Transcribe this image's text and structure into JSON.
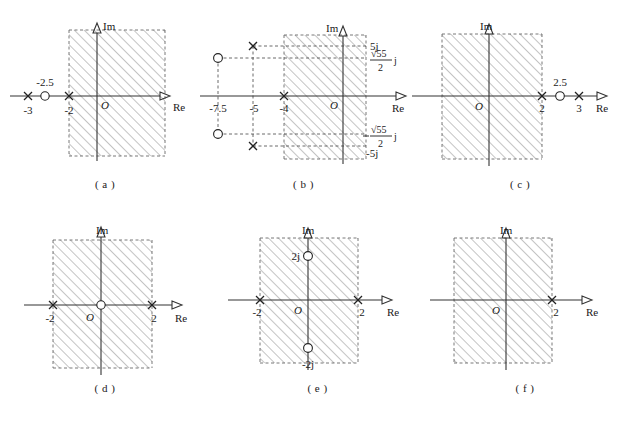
{
  "figure": {
    "type": "pole-zero-plots-with-roc",
    "panel_count": 6,
    "axis_labels": {
      "real": "Re",
      "imag": "Im",
      "origin": "O"
    },
    "marker_legend": {
      "pole": "x",
      "zero": "o"
    },
    "hatch_color": "#8a8a8a",
    "axis_color": "#333333"
  },
  "panels": [
    {
      "id": "a",
      "caption": "( a )",
      "im_label": "Im",
      "re_label": "Re",
      "origin_label": "O",
      "poles": [
        {
          "label": "-3",
          "re": -3,
          "im": 0
        },
        {
          "label": "-2",
          "re": -2,
          "im": 0
        }
      ],
      "zeros": [
        {
          "label": "-2.5",
          "re": -2.5,
          "im": 0
        }
      ],
      "roc": {
        "kind": "right-half",
        "boundary_label": "-2",
        "boundary_re": -2
      }
    },
    {
      "id": "b",
      "caption": "( b )",
      "im_label": "Im",
      "re_label": "Re",
      "origin_label": "O",
      "poles": [
        {
          "label": "-5",
          "re": -5,
          "im": 5
        },
        {
          "label": "-5",
          "re": -5,
          "im": -5
        },
        {
          "label": "-4",
          "re": -4,
          "im": 0
        }
      ],
      "zeros": [
        {
          "label": "-7.5",
          "re": -7.5,
          "im": 3.708
        },
        {
          "label": "-7.5",
          "re": -7.5,
          "im": -3.708
        }
      ],
      "axis_ticks": [
        "-7.5",
        "-5",
        "-4"
      ],
      "imag_ticks": [
        {
          "text": "5j",
          "kind": "plain"
        },
        {
          "text": "√55/2 j",
          "kind": "fraction",
          "numerator": "√55",
          "denominator": "2",
          "suffix": "j"
        },
        {
          "text": "√55/2 j",
          "kind": "fraction",
          "numerator": "√55",
          "denominator": "2",
          "suffix": "j",
          "negative": true
        },
        {
          "text": "-5j",
          "kind": "plain"
        }
      ],
      "roc": {
        "kind": "right-half",
        "boundary_label": "-4",
        "boundary_re": -4
      }
    },
    {
      "id": "c",
      "caption": "( c )",
      "im_label": "Im",
      "re_label": "Re",
      "origin_label": "O",
      "poles": [
        {
          "label": "2",
          "re": 2,
          "im": 0
        },
        {
          "label": "3",
          "re": 3,
          "im": 0
        }
      ],
      "zeros": [
        {
          "label": "2.5",
          "re": 2.5,
          "im": 0
        }
      ],
      "roc": {
        "kind": "left-half",
        "boundary_label": "2",
        "boundary_re": 2
      }
    },
    {
      "id": "d",
      "caption": "( d )",
      "im_label": "Im",
      "re_label": "Re",
      "origin_label": "O",
      "poles": [
        {
          "label": "-2",
          "re": -2,
          "im": 0
        },
        {
          "label": "2",
          "re": 2,
          "im": 0
        }
      ],
      "zeros": [
        {
          "label": "",
          "re": 0,
          "im": 0
        }
      ],
      "roc": {
        "kind": "strip",
        "left_label": "-2",
        "right_label": "2",
        "left_re": -2,
        "right_re": 2
      }
    },
    {
      "id": "e",
      "caption": "( e )",
      "im_label": "Im",
      "re_label": "Re",
      "origin_label": "O",
      "poles": [
        {
          "label": "-2",
          "re": -2,
          "im": 0
        },
        {
          "label": "2",
          "re": 2,
          "im": 0
        }
      ],
      "zeros": [
        {
          "label": "2j",
          "re": 0,
          "im": 2
        },
        {
          "label": "-2j",
          "re": 0,
          "im": -2
        }
      ],
      "roc": {
        "kind": "strip",
        "left_label": "-2",
        "right_label": "2",
        "left_re": -2,
        "right_re": 2
      }
    },
    {
      "id": "f",
      "caption": "( f )",
      "im_label": "Im",
      "re_label": "Re",
      "origin_label": "O",
      "poles": [
        {
          "label": "2",
          "re": 2,
          "im": 0
        }
      ],
      "zeros": [],
      "roc": {
        "kind": "left-half",
        "boundary_label": "2",
        "boundary_re": 2
      }
    }
  ]
}
